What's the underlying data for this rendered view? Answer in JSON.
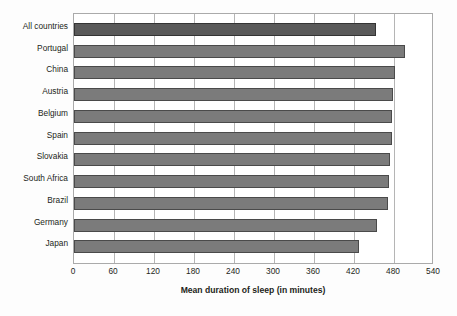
{
  "chart_data": {
    "type": "bar",
    "orientation": "horizontal",
    "title": "",
    "subtitle": "",
    "xlabel": "Mean duration of sleep (in minutes)",
    "ylabel": "",
    "xlim": [
      0,
      540
    ],
    "xticks": [
      0,
      60,
      120,
      180,
      240,
      300,
      360,
      420,
      480,
      540
    ],
    "xtick_labels": [
      "0",
      "60",
      "120",
      "180",
      "240",
      "300",
      "360",
      "420",
      "480",
      "540"
    ],
    "grid": true,
    "grid_axis": "x",
    "legend": false,
    "legend_position": "none",
    "categories": [
      "All countries",
      "Portugal",
      "China",
      "Austria",
      "Belgium",
      "Spain",
      "Slovakia",
      "South Africa",
      "Brazil",
      "Germany",
      "Japan"
    ],
    "values": [
      453,
      496,
      481,
      478,
      477,
      477,
      474,
      472,
      471,
      454,
      427
    ],
    "series": [
      {
        "name": "Mean duration of sleep (in minutes)",
        "values": [
          453,
          496,
          481,
          478,
          477,
          477,
          474,
          472,
          471,
          454,
          427
        ]
      }
    ],
    "bar_color": "#7b7b7b",
    "bar_edge_color": "#4a4a4a",
    "accent_bar_color": "#5a5a5a",
    "accent_bar_edge_color": "#343434",
    "accent_category": "All countries",
    "frame_color": "#aaaaaa",
    "gridline_color": "#b5b5b5",
    "background_color": "#fdfdfd",
    "text_color": "#231f20"
  }
}
